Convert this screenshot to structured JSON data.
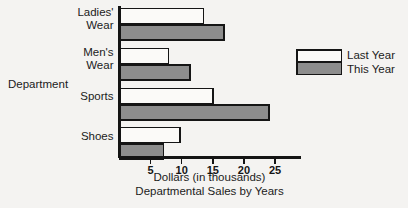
{
  "chart_data": {
    "type": "bar",
    "orientation": "horizontal",
    "title": "Departmental Sales by Years",
    "xlabel": "Dollars (in thousands)",
    "ylabel": "Department",
    "categories": [
      "Ladies' Wear",
      "Men's Wear",
      "Sports",
      "Shoes"
    ],
    "series": [
      {
        "name": "Last Year",
        "color": "#fbfaf8",
        "values": [
          13.5,
          7.9,
          15.0,
          9.7
        ]
      },
      {
        "name": "This Year",
        "color": "#8d8d8d",
        "values": [
          16.8,
          11.3,
          24.0,
          7.1
        ]
      }
    ],
    "xlim": [
      0,
      29
    ],
    "xticks": [
      5,
      10,
      15,
      20,
      25
    ],
    "xtick_labels": [
      "5",
      "10",
      "15",
      "20",
      "25"
    ],
    "grid": false,
    "legend_position": "right"
  },
  "labels": {
    "category_lines": [
      [
        "Ladies'",
        "Wear"
      ],
      [
        "Men's",
        "Wear"
      ],
      [
        "Sports"
      ],
      [
        "Shoes"
      ]
    ],
    "y_axis_title": "Department",
    "x_axis_title": "Dollars (in thousands)",
    "caption": "Departmental Sales by Years"
  },
  "legend": {
    "entries": [
      {
        "label": "Last Year",
        "swatch": "last-year-swatch"
      },
      {
        "label": "This Year",
        "swatch": "this-year-swatch"
      }
    ]
  }
}
